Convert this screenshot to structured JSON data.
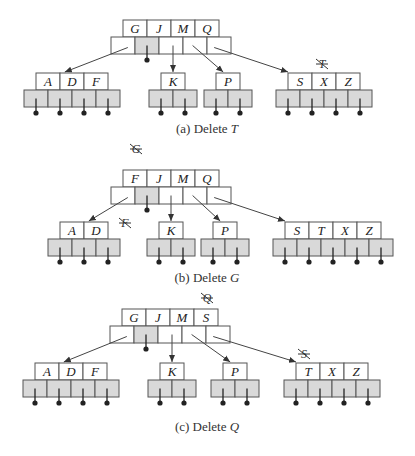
{
  "figure": {
    "cell_width": 24,
    "key_height": 17,
    "ptr_height": 17,
    "colors": {
      "stroke": "#555555",
      "shaded": "#d9d9d9",
      "text": "#222222"
    },
    "panels": [
      {
        "id": "a",
        "caption_prefix": "(a) Delete ",
        "caption_var": "T",
        "caption_y": 133,
        "root": {
          "x": 111,
          "y": 20,
          "keys": [
            "G",
            "J",
            "M",
            "Q"
          ],
          "shaded_ptrs": [
            1
          ],
          "stub_ptrs": [
            1
          ]
        },
        "leaves": [
          {
            "x": 24,
            "y": 73,
            "keys": [
              "A",
              "D",
              "F"
            ],
            "from_ptr": 0
          },
          {
            "x": 149,
            "y": 73,
            "keys": [
              "K"
            ],
            "from_ptr": 2
          },
          {
            "x": 204,
            "y": 73,
            "keys": [
              "P"
            ],
            "from_ptr": 3
          },
          {
            "x": 276,
            "y": 73,
            "keys": [
              "S",
              "X",
              "Z"
            ],
            "from_ptr": 4
          }
        ],
        "struck": [
          {
            "letter": "T",
            "x": 322,
            "y": 68
          }
        ]
      },
      {
        "id": "b",
        "caption_prefix": "(b) Delete ",
        "caption_var": "G",
        "caption_y": 282,
        "root": {
          "x": 111,
          "y": 170,
          "keys": [
            "F",
            "J",
            "M",
            "Q"
          ],
          "shaded_ptrs": [
            1
          ],
          "stub_ptrs": [
            1
          ]
        },
        "leaves": [
          {
            "x": 48,
            "y": 222,
            "keys": [
              "A",
              "D"
            ],
            "from_ptr": 0
          },
          {
            "x": 147,
            "y": 222,
            "keys": [
              "K"
            ],
            "from_ptr": 2
          },
          {
            "x": 201,
            "y": 222,
            "keys": [
              "P"
            ],
            "from_ptr": 3
          },
          {
            "x": 273,
            "y": 222,
            "keys": [
              "S",
              "T",
              "X",
              "Z"
            ],
            "from_ptr": 4
          }
        ],
        "struck": [
          {
            "letter": "G",
            "x": 136,
            "y": 153
          },
          {
            "letter": "F",
            "x": 125,
            "y": 227
          }
        ]
      },
      {
        "id": "c",
        "caption_prefix": "(c) Delete ",
        "caption_var": "Q",
        "caption_y": 431,
        "root": {
          "x": 110,
          "y": 309,
          "keys": [
            "G",
            "J",
            "M",
            "S"
          ],
          "shaded_ptrs": [
            1
          ],
          "stub_ptrs": [
            1
          ]
        },
        "leaves": [
          {
            "x": 23,
            "y": 363,
            "keys": [
              "A",
              "D",
              "F"
            ],
            "from_ptr": 0
          },
          {
            "x": 148,
            "y": 363,
            "keys": [
              "K"
            ],
            "from_ptr": 2
          },
          {
            "x": 211,
            "y": 363,
            "keys": [
              "P"
            ],
            "from_ptr": 3
          },
          {
            "x": 284,
            "y": 363,
            "keys": [
              "T",
              "X",
              "Z"
            ],
            "from_ptr": 4
          }
        ],
        "struck": [
          {
            "letter": "Q",
            "x": 207,
            "y": 302
          },
          {
            "letter": "S",
            "x": 304,
            "y": 358
          }
        ]
      }
    ]
  }
}
